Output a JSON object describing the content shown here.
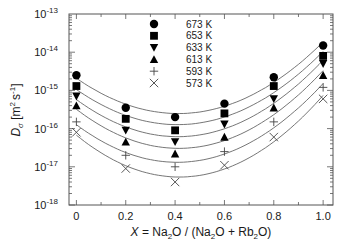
{
  "chart_data": {
    "type": "scatter",
    "title": "",
    "xlabel_parts": {
      "X": "X",
      "eq": " = Na",
      "sub1": "2",
      "mid1": "O / (Na",
      "sub2": "2",
      "mid2": "O + Rb",
      "sub3": "2",
      "end": "O)"
    },
    "xlabel": "X = Na2O / (Na2O + Rb2O)",
    "ylabel": "D_σ [m^2 s^-1]",
    "ylabel_parts": {
      "D": "D",
      "sigma": "σ",
      "unit_open": " [m",
      "sup2": "2",
      "unit_s": "s",
      "supm1": "-1",
      "unit_close": "]"
    },
    "xlim": [
      -0.03,
      1.04
    ],
    "ylim": [
      1e-18,
      1e-13
    ],
    "yscale": "log",
    "grid": false,
    "legend_position": "top-center",
    "x": [
      0,
      0.2,
      0.4,
      0.6,
      0.8,
      1.0
    ],
    "x_tick_labels": [
      "0",
      "0.2",
      "0.4",
      "0.6",
      "0.8",
      "1.0"
    ],
    "y_tick_labels": [
      {
        "base": "10",
        "exp": "-13",
        "value": 1e-13
      },
      {
        "base": "10",
        "exp": "-14",
        "value": 1e-14
      },
      {
        "base": "10",
        "exp": "-15",
        "value": 1e-15
      },
      {
        "base": "10",
        "exp": "-16",
        "value": 1e-16
      },
      {
        "base": "10",
        "exp": "-17",
        "value": 1e-17
      },
      {
        "base": "10",
        "exp": "-18",
        "value": 1e-18
      }
    ],
    "series": [
      {
        "name": "673 K",
        "marker": "circle",
        "values": [
          2.5e-15,
          3.5e-16,
          2e-16,
          4.5e-16,
          2.2e-15,
          1.5e-14
        ]
      },
      {
        "name": "653 K",
        "marker": "square",
        "values": [
          1.3e-15,
          1.8e-16,
          9e-17,
          2.5e-16,
          1.3e-15,
          8e-15
        ]
      },
      {
        "name": "633 K",
        "marker": "triangle-down",
        "values": [
          7e-16,
          9e-17,
          4.5e-17,
          1.3e-16,
          6e-16,
          5e-15
        ]
      },
      {
        "name": "613 K",
        "marker": "triangle-up",
        "values": [
          4e-16,
          4.5e-17,
          2.2e-17,
          6e-17,
          3.5e-16,
          2.5e-15
        ]
      },
      {
        "name": "593 K",
        "marker": "plus",
        "values": [
          1.5e-16,
          2e-17,
          1e-17,
          2.5e-17,
          1.5e-16,
          1.2e-15
        ]
      },
      {
        "name": "573 K",
        "marker": "cross",
        "values": [
          8e-17,
          9e-18,
          4e-18,
          1.1e-17,
          6e-17,
          6e-16
        ]
      }
    ],
    "fit_curves": "smooth fitted line through each series"
  }
}
